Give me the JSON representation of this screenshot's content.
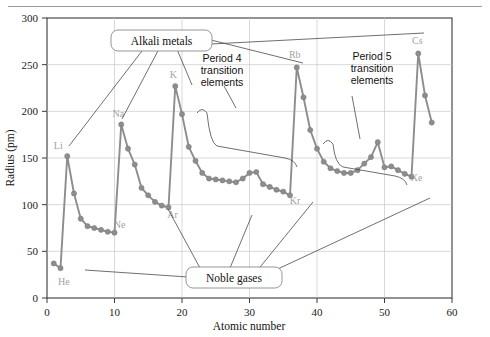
{
  "chart_data": {
    "type": "line",
    "title": "",
    "xlabel": "Atomic number",
    "ylabel": "Radius (pm)",
    "xlim": [
      0,
      60
    ],
    "ylim": [
      0,
      300
    ],
    "xticks": [
      0,
      10,
      20,
      30,
      40,
      50,
      60
    ],
    "yticks": [
      0,
      50,
      100,
      150,
      200,
      250,
      300
    ],
    "grid": true,
    "legend": "none",
    "series_color": "#8d8d8d",
    "series": [
      {
        "name": "Atomic radius",
        "x": [
          1,
          2,
          3,
          4,
          5,
          6,
          7,
          8,
          9,
          10,
          11,
          12,
          13,
          14,
          15,
          16,
          17,
          18,
          19,
          20,
          21,
          22,
          23,
          24,
          25,
          26,
          27,
          28,
          29,
          30,
          31,
          32,
          33,
          34,
          35,
          36,
          37,
          38,
          39,
          40,
          41,
          42,
          43,
          44,
          45,
          46,
          47,
          48,
          49,
          50,
          51,
          52,
          53,
          54,
          55,
          56,
          57
        ],
        "y": [
          37,
          32,
          152,
          112,
          85,
          77,
          75,
          73,
          71,
          70,
          186,
          160,
          143,
          118,
          110,
          103,
          99,
          97,
          227,
          197,
          162,
          147,
          134,
          128,
          127,
          126,
          125,
          124,
          128,
          134,
          135,
          122,
          119,
          116,
          114,
          110,
          247,
          215,
          180,
          160,
          146,
          139,
          136,
          134,
          134,
          137,
          144,
          151,
          167,
          140,
          141,
          137,
          133,
          130,
          262,
          217,
          188
        ]
      }
    ],
    "point_labels": [
      {
        "text": "He",
        "x": 1.6,
        "y": 33,
        "dx": 6,
        "dy": 18
      },
      {
        "text": "Li",
        "x": 3,
        "y": 152,
        "dx": -9,
        "dy": -7
      },
      {
        "text": "Ne",
        "x": 10,
        "y": 70,
        "dx": 5,
        "dy": -5
      },
      {
        "text": "Na",
        "x": 11,
        "y": 186,
        "dx": -3,
        "dy": -7
      },
      {
        "text": "Ar",
        "x": 18,
        "y": 97,
        "dx": 4,
        "dy": 11
      },
      {
        "text": "K",
        "x": 19,
        "y": 227,
        "dx": -2,
        "dy": -8
      },
      {
        "text": "Kr",
        "x": 36,
        "y": 110,
        "dx": 5,
        "dy": 9
      },
      {
        "text": "Rb",
        "x": 37,
        "y": 247,
        "dx": -2,
        "dy": -9
      },
      {
        "text": "Xe",
        "x": 54,
        "y": 130,
        "dx": 5,
        "dy": 4
      },
      {
        "text": "Cs",
        "x": 55,
        "y": 262,
        "dx": -1,
        "dy": -9
      }
    ],
    "annotations": [
      {
        "name": "alkali-metals-callout",
        "text": "Alkali metals",
        "kind": "box"
      },
      {
        "name": "noble-gases-callout",
        "text": "Noble gases",
        "kind": "box"
      },
      {
        "name": "period-4-annotation",
        "text": [
          "Period 4",
          "transition",
          "elements"
        ],
        "kind": "brace"
      },
      {
        "name": "period-5-annotation",
        "text": [
          "Period 5",
          "transition",
          "elements"
        ],
        "kind": "brace"
      }
    ]
  },
  "annotation_text": {
    "alkali_metals": "Alkali metals",
    "noble_gases": "Noble gases",
    "period4_line1": "Period 4",
    "period4_line2": "transition",
    "period4_line3": "elements",
    "period5_line1": "Period 5",
    "period5_line2": "transition",
    "period5_line3": "elements"
  },
  "axes": {
    "xlabel": "Atomic number",
    "ylabel": "Radius (pm)",
    "xticks": [
      "0",
      "10",
      "20",
      "30",
      "40",
      "50",
      "60"
    ],
    "yticks": [
      "0",
      "50",
      "100",
      "150",
      "200",
      "250",
      "300"
    ]
  }
}
